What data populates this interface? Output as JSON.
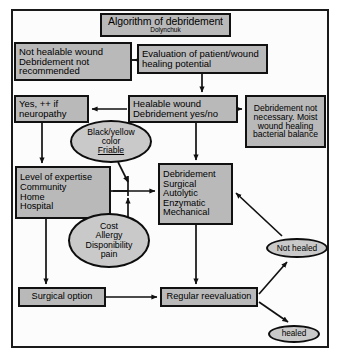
{
  "figure": {
    "title": "Algorithm of debridement",
    "author": "Dolynchuk",
    "colors": {
      "node_fill": "#b9b9b9",
      "ellipse_fill": "#c9c9c9",
      "border": "#111111",
      "background": "#ffffff"
    }
  },
  "nodes": {
    "title_box": {
      "line1": "Algorithm of debridement",
      "line2": "Dolynchuk",
      "shape": "rectangle"
    },
    "not_healable": {
      "shape": "rectangle",
      "lines": [
        "Not healable wound",
        "Debridement not",
        "recommended"
      ]
    },
    "evaluation": {
      "shape": "rectangle",
      "lines": [
        "Evaluation of patient/wound",
        "healing potential"
      ]
    },
    "yes_neuropathy": {
      "shape": "rectangle",
      "lines": [
        "Yes, ++ if",
        "neuropathy"
      ]
    },
    "healable_wound": {
      "shape": "rectangle",
      "lines": [
        "Healable wound",
        "Debridement yes/no"
      ]
    },
    "debridement_not_necessary": {
      "shape": "rectangle",
      "lines": [
        "Debridement not",
        "necessary. Moist",
        "wound healing",
        "bacterial balance"
      ]
    },
    "black_yellow": {
      "shape": "ellipse",
      "lines": [
        "Black/yellow",
        "color",
        "Friable"
      ]
    },
    "level_of_expertise": {
      "shape": "rectangle",
      "lines": [
        "Level of expertise",
        "Community",
        "Home",
        "Hospital"
      ]
    },
    "debridement_types": {
      "shape": "rectangle",
      "lines": [
        "Debridement",
        "Surgical",
        "Autolytic",
        "Enzymatic",
        "Mechanical"
      ]
    },
    "cost_allergy": {
      "shape": "ellipse",
      "lines": [
        "Cost",
        "Allergy",
        "Disponibility",
        "pain"
      ]
    },
    "not_healed": {
      "shape": "ellipse",
      "lines": [
        "Not healed"
      ]
    },
    "surgical_option": {
      "shape": "rectangle",
      "lines": [
        "Surgical option"
      ]
    },
    "regular_reevaluation": {
      "shape": "rectangle",
      "lines": [
        "Regular reevaluation"
      ]
    },
    "healed": {
      "shape": "ellipse",
      "lines": [
        "healed"
      ]
    }
  },
  "edges": [
    {
      "from": "evaluation",
      "to": "not_healable",
      "type": "arrow-left"
    },
    {
      "from": "evaluation",
      "to": "healable_wound",
      "type": "arrow-down"
    },
    {
      "from": "healable_wound",
      "to": "yes_neuropathy",
      "type": "arrow-left"
    },
    {
      "from": "healable_wound",
      "to": "debridement_not_necessary",
      "type": "arrow-right"
    },
    {
      "from": "healable_wound",
      "to": "debridement_types",
      "type": "arrow-down"
    },
    {
      "from": "yes_neuropathy",
      "to": "level_of_expertise",
      "type": "arrow-down"
    },
    {
      "from": "black_yellow",
      "to": "debridement_types",
      "type": "arrow-down-right"
    },
    {
      "from": "cost_allergy",
      "to": "debridement_types",
      "type": "arrow-up-right"
    },
    {
      "from": "level_of_expertise",
      "to": "debridement_types",
      "type": "arrow-right"
    },
    {
      "from": "level_of_expertise",
      "to": "surgical_option",
      "type": "arrow-down"
    },
    {
      "from": "surgical_option",
      "to": "regular_reevaluation",
      "type": "arrow-right"
    },
    {
      "from": "debridement_types",
      "to": "regular_reevaluation",
      "type": "arrow-down"
    },
    {
      "from": "regular_reevaluation",
      "to": "not_healed",
      "type": "arrow-up-right"
    },
    {
      "from": "regular_reevaluation",
      "to": "healed",
      "type": "arrow-down-right"
    },
    {
      "from": "not_healed",
      "to": "debridement_types",
      "type": "arrow-up-left"
    }
  ]
}
